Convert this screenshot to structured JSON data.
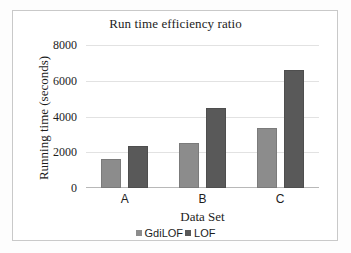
{
  "chart_data": {
    "type": "bar",
    "title": "Run time efficiency ratio",
    "xlabel": "Data Set",
    "ylabel": "Running time (seconds)",
    "categories": [
      "A",
      "B",
      "C"
    ],
    "series": [
      {
        "name": "GdiLOF",
        "color": "#8c8c8c",
        "values": [
          1650,
          2520,
          3350
        ]
      },
      {
        "name": "LOF",
        "color": "#595959",
        "values": [
          2350,
          4470,
          6620
        ]
      }
    ],
    "ylim": [
      0,
      8000
    ],
    "yticks": [
      0,
      2000,
      4000,
      6000,
      8000
    ],
    "ytick_labels": [
      "0",
      "2000",
      "4000",
      "6000",
      "8000"
    ],
    "grid": true,
    "legend_position": "bottom"
  }
}
